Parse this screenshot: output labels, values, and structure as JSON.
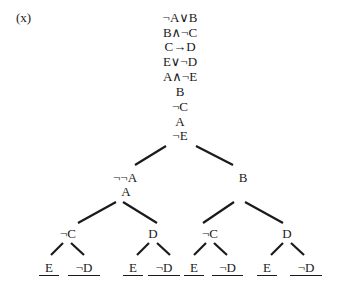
{
  "problem_label": "(x)",
  "trunk": [
    "¬A∨B",
    "B∧¬C",
    "C→D",
    "E∨¬D",
    "A∧¬E",
    "B",
    "¬C",
    "A",
    "¬E"
  ],
  "branches": {
    "left": {
      "nodes": [
        "¬¬A",
        "A"
      ],
      "children": [
        {
          "node": "¬C",
          "leaves": [
            "E",
            "¬D"
          ]
        },
        {
          "node": "D",
          "leaves": [
            "E",
            "¬D"
          ]
        }
      ]
    },
    "right": {
      "nodes": [
        "B"
      ],
      "children": [
        {
          "node": "¬C",
          "leaves": [
            "E",
            "¬D"
          ]
        },
        {
          "node": "D",
          "leaves": [
            "E",
            "¬D"
          ]
        }
      ]
    }
  },
  "leaves_closed": true
}
